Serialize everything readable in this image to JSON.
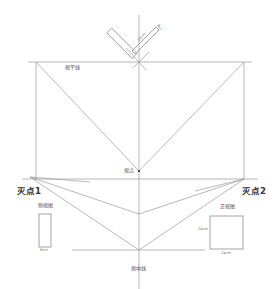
{
  "diagram": {
    "type": "two-point perspective construction",
    "labels": {
      "horizon_line": "视平线",
      "viewpoint": "视点",
      "vanishing_point_1": "灭点1",
      "vanishing_point_2": "灭点2",
      "side_view": "侧视图",
      "front_view": "正视图",
      "center_line": "视中线"
    },
    "dimensions": {
      "top_box_length": "24cm",
      "top_box_width": "8",
      "side_view_width": "8cm",
      "front_view_height": "24cm",
      "front_view_width": "24cm"
    },
    "colors": {
      "line": "#9a9a9a",
      "text": "#555555",
      "background": "#ffffff"
    }
  }
}
